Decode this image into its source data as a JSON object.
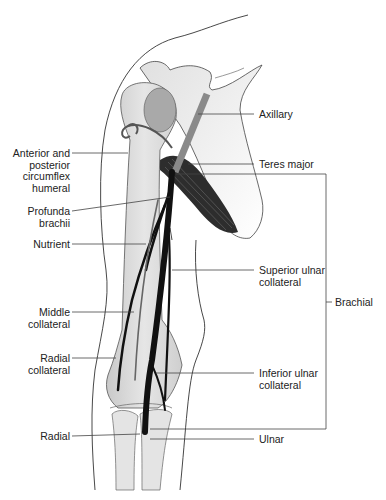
{
  "figure": {
    "colors": {
      "line": "#444444",
      "artery": "#111111",
      "nerve_band": "#8a8a8a",
      "bone": "#dcdcdc",
      "skin_outline": "#333333",
      "muscle": "#2a2a2a"
    }
  },
  "labels": {
    "left": [
      {
        "id": "circumflex",
        "text": "Anterior and\nposterior\ncircumflex\nhumeral"
      },
      {
        "id": "profunda",
        "text": "Profunda\nbrachii"
      },
      {
        "id": "nutrient",
        "text": "Nutrient"
      },
      {
        "id": "middle",
        "text": "Middle\ncollateral"
      },
      {
        "id": "radial_collateral",
        "text": "Radial\ncollateral"
      },
      {
        "id": "radial",
        "text": "Radial"
      }
    ],
    "right": [
      {
        "id": "axillary",
        "text": "Axillary"
      },
      {
        "id": "teres",
        "text": "Teres major"
      },
      {
        "id": "superior_ulnar",
        "text": "Superior ulnar\ncollateral"
      },
      {
        "id": "inferior_ulnar",
        "text": "Inferior ulnar\ncollateral"
      },
      {
        "id": "ulnar",
        "text": "Ulnar"
      },
      {
        "id": "brachial",
        "text": "Brachial"
      }
    ]
  }
}
